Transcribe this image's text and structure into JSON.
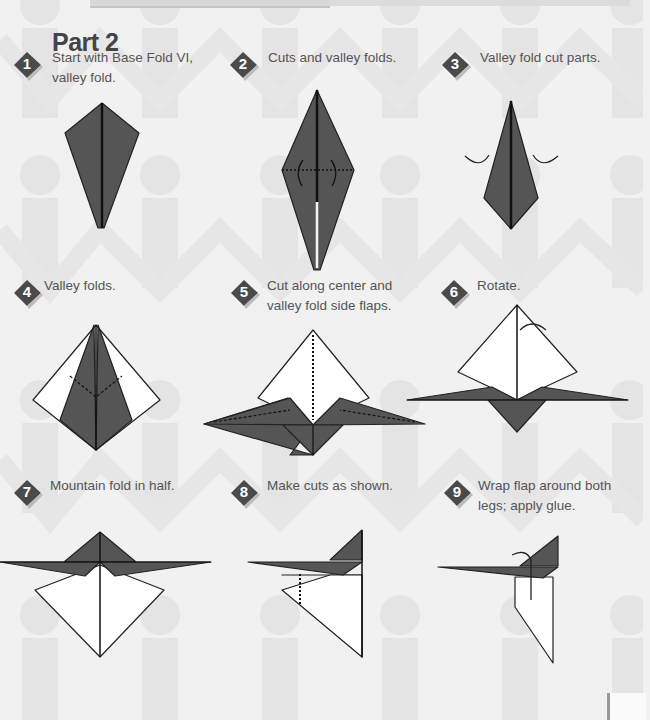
{
  "page": {
    "title": "Part 2",
    "colors": {
      "paper_dark": "#555555",
      "paper_light": "#ffffff",
      "badge": "#4a4a4a",
      "text": "#555555",
      "background": "#f1f1f1",
      "silhouette": "#e2e2e2"
    }
  },
  "steps": [
    {
      "number": "1",
      "caption_line1": "Start with Base Fold VI,",
      "caption_line2": "valley fold."
    },
    {
      "number": "2",
      "caption_line1": "Cuts and valley folds.",
      "caption_line2": ""
    },
    {
      "number": "3",
      "caption_line1": "Valley fold cut parts.",
      "caption_line2": ""
    },
    {
      "number": "4",
      "caption_line1": "Valley folds.",
      "caption_line2": ""
    },
    {
      "number": "5",
      "caption_line1": "Cut along center and",
      "caption_line2": "valley fold side flaps."
    },
    {
      "number": "6",
      "caption_line1": "Rotate.",
      "caption_line2": ""
    },
    {
      "number": "7",
      "caption_line1": "Mountain fold in half.",
      "caption_line2": ""
    },
    {
      "number": "8",
      "caption_line1": "Make cuts as shown.",
      "caption_line2": ""
    },
    {
      "number": "9",
      "caption_line1": "Wrap flap around both",
      "caption_line2": "legs; apply glue."
    }
  ]
}
